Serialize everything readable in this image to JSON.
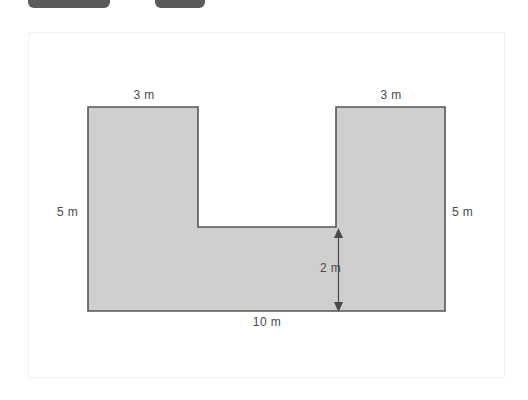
{
  "toolbar": {
    "pill_one_label": "",
    "pill_two_label": ""
  },
  "figure": {
    "caption": "",
    "shape_name": "U-shaped polygon",
    "colors": {
      "shape_fill": "#cfcfcf",
      "shape_stroke": "#555555",
      "frame_border": "#f2f2f2",
      "label_text": "#4a4a4a",
      "toolbar_pill": "#5a5a5a",
      "background": "#ffffff"
    },
    "labels": {
      "top_left": "3 m",
      "top_right": "3 m",
      "left_side": "5 m",
      "right_side": "5 m",
      "notch_depth": "2 m",
      "bottom": "10 m"
    },
    "dimensions": {
      "left_arm_width": "3 m",
      "right_arm_width": "3 m",
      "left_height": "5 m",
      "right_height": "5 m",
      "notch_depth": "2 m",
      "total_width": "10 m"
    }
  }
}
